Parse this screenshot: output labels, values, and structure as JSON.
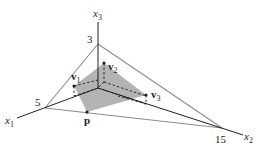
{
  "diagram": {
    "axes": {
      "x1": {
        "label": "x",
        "sub": "1",
        "intercept": "5"
      },
      "x2": {
        "label": "x",
        "sub": "2",
        "intercept": "15"
      },
      "x3": {
        "label": "x",
        "sub": "3",
        "intercept": "3"
      }
    },
    "points": {
      "v1": {
        "label": "v",
        "sub": "1"
      },
      "v2": {
        "label": "v",
        "sub": "2"
      },
      "v3": {
        "label": "v",
        "sub": "3"
      },
      "p": {
        "label": "p"
      }
    },
    "colors": {
      "axis": "#231f20",
      "plane_edge": "#8c8c8c",
      "shaded_region": "#b3b3b3",
      "dashed": "#231f20"
    }
  }
}
